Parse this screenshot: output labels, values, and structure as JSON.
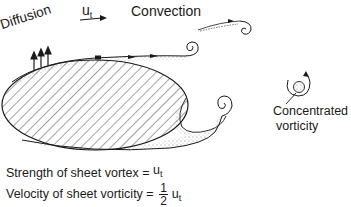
{
  "diagram": {
    "labels": {
      "diffusion": "Diffusion",
      "ut_symbol": "u",
      "ut_subscript": "t",
      "convection": "Convection",
      "concentrated_line1": "Concentrated",
      "concentrated_line2": "vorticity"
    },
    "equations": {
      "strength_label": "Strength of sheet vortex =",
      "strength_symbol": "u",
      "strength_subscript": "t",
      "velocity_label": "Velocity of sheet vorticity =",
      "velocity_fraction_num": "1",
      "velocity_fraction_den": "2",
      "velocity_symbol": "u",
      "velocity_subscript": "t"
    },
    "colors": {
      "ink": "#1a1a1a",
      "background": "#ffffff"
    }
  }
}
